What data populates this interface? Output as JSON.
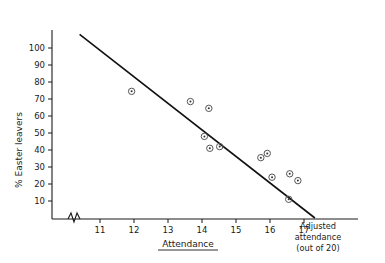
{
  "chart_data": {
    "type": "scatter",
    "title": "",
    "xlabel": "Attendance",
    "ylabel": "% Easter leavers",
    "xlim": [
      10.4,
      17.6
    ],
    "ylim": [
      0,
      108
    ],
    "grid": false,
    "legend": "none",
    "x_ticks": [
      "11",
      "12",
      "13",
      "14",
      "15",
      "16",
      "17"
    ],
    "x_tick_values": [
      11,
      12,
      13,
      14,
      15,
      16,
      17
    ],
    "y_ticks": [
      "10",
      "20",
      "30",
      "40",
      "50",
      "60",
      "70",
      "80",
      "90",
      "100"
    ],
    "y_tick_values": [
      10,
      20,
      30,
      40,
      50,
      60,
      70,
      80,
      90,
      100
    ],
    "axis_break": true,
    "corner_label_lines": [
      "Adjusted",
      "attendance",
      "(out of 20)"
    ],
    "points": [
      {
        "x": 11.93,
        "y": 74.5
      },
      {
        "x": 13.66,
        "y": 68.5
      },
      {
        "x": 14.2,
        "y": 64.5
      },
      {
        "x": 14.07,
        "y": 48.0
      },
      {
        "x": 14.23,
        "y": 41.0
      },
      {
        "x": 14.52,
        "y": 42.0
      },
      {
        "x": 15.73,
        "y": 35.5
      },
      {
        "x": 15.92,
        "y": 38.0
      },
      {
        "x": 16.06,
        "y": 24.0
      },
      {
        "x": 16.58,
        "y": 26.0
      },
      {
        "x": 16.82,
        "y": 22.0
      },
      {
        "x": 16.55,
        "y": 11.0
      }
    ],
    "fit_line": {
      "x_start": 10.4,
      "y_start": 108.0,
      "x_end": 17.32,
      "y_end": 0.0
    }
  }
}
